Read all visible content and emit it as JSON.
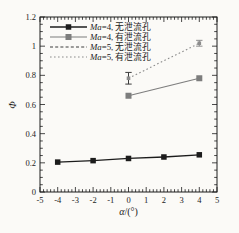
{
  "figure": {
    "background": "#fbfaf7",
    "frame_color": "#1c1c1c",
    "text_color": "#1c1c1c"
  },
  "chart_data": {
    "type": "line",
    "title": "",
    "xlabel_italic": "α",
    "xlabel_rest": "/(°)",
    "xlabel_full": "α/(°)",
    "ylabel": "Φ",
    "xlim": [
      -5,
      5
    ],
    "ylim": [
      0,
      1.2
    ],
    "x_major_ticks": [
      -5,
      -4,
      -3,
      -2,
      -1,
      0,
      1,
      2,
      3,
      4,
      5
    ],
    "x_tick_labels": [
      "-5",
      "-4",
      "-3",
      "-2",
      "-1",
      "0",
      "1",
      "2",
      "3",
      "4",
      "5"
    ],
    "y_major_ticks": [
      0,
      0.2,
      0.4,
      0.6,
      0.8,
      1,
      1.2
    ],
    "y_tick_labels": [
      "0",
      "0.2",
      "0.4",
      "0.6",
      "0.8",
      "1",
      "1.2"
    ],
    "x_minor_step": 0.2,
    "y_minor_step": 0.05,
    "grid": false,
    "legend_position": "upper-left",
    "series": [
      {
        "name": "Ma=4, 无泄流孔",
        "name_italic": "Ma",
        "name_rest": "=4, 无泄流孔",
        "line": "solid",
        "color": "#1c1c1c",
        "width": 1.3,
        "marker": "square",
        "marker_size": 5.5,
        "marker_color": "#1c1c1c",
        "x": [
          -4,
          -2,
          0,
          2,
          4
        ],
        "y": [
          0.205,
          0.215,
          0.23,
          0.24,
          0.255
        ],
        "yerr": []
      },
      {
        "name": "Ma=4, 有泄流孔",
        "name_italic": "Ma",
        "name_rest": "=4, 有泄流孔",
        "line": "solid",
        "color": "#7d7d7d",
        "width": 1.2,
        "marker": "square",
        "marker_size": 6,
        "marker_color": "#7d7d7d",
        "x": [
          0,
          4
        ],
        "y": [
          0.66,
          0.78
        ],
        "yerr": []
      },
      {
        "name": "Ma=5, 无泄流孔",
        "name_italic": "Ma",
        "name_rest": "=5, 无泄流孔",
        "line": "dashed",
        "dash": "3 2.2",
        "color": "#3c3c3c",
        "width": 1,
        "marker": "none",
        "marker_size": 0,
        "marker_color": "#3c3c3c",
        "x": [
          0
        ],
        "y": [
          0.78
        ],
        "yerr": [
          0.04
        ]
      },
      {
        "name": "Ma=5, 有泄流孔",
        "name_italic": "Ma",
        "name_rest": "=5, 有泄流孔",
        "line": "dotted",
        "dash": "1.6 2.4",
        "color": "#8c8c8c",
        "width": 1.1,
        "marker": "square-small",
        "marker_size": 3.6,
        "marker_color": "#8c8c8c",
        "x": [
          0,
          4
        ],
        "y": [
          0.78,
          1.02
        ],
        "yerr": [
          0,
          0.02
        ]
      }
    ]
  }
}
